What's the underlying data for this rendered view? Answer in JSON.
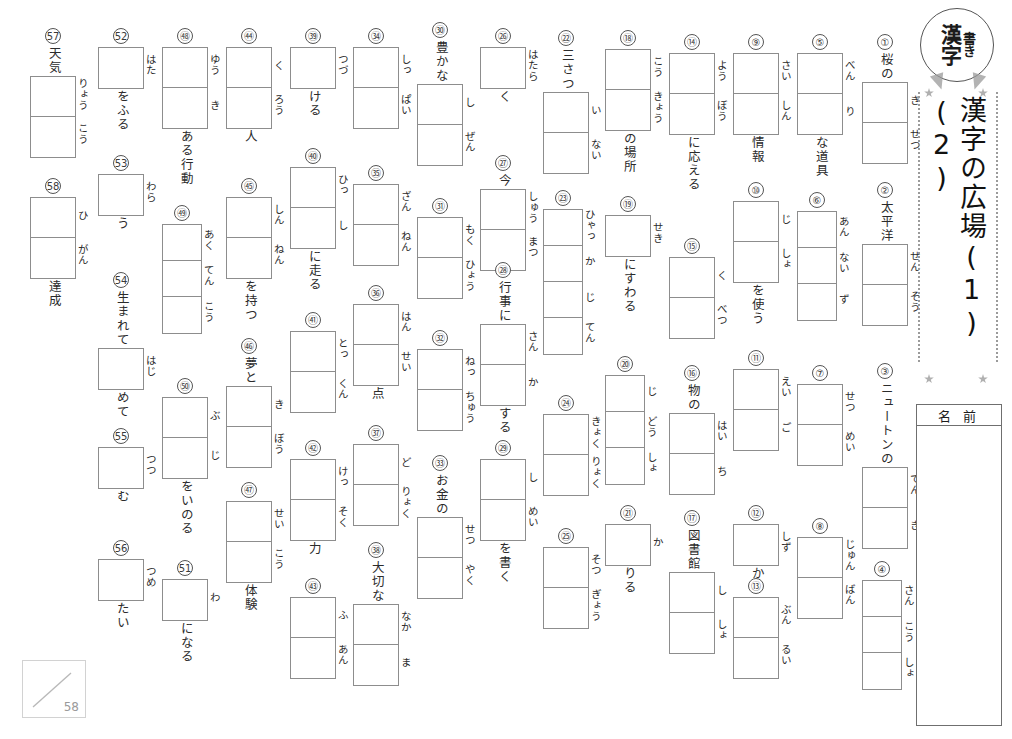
{
  "header": {
    "badge_main": "漢字",
    "badge_sub": "書き",
    "title": "漢字の広場",
    "unit_1": "(1)",
    "unit_2": "(2)",
    "name_label": "名 前"
  },
  "score": {
    "total": "58"
  },
  "problems": [
    {
      "no": "①",
      "pre": "桜の",
      "post": "",
      "readings": [
        "き",
        "せつ"
      ],
      "cells": 2
    },
    {
      "no": "②",
      "pre": "太平洋",
      "post": "",
      "readings": [
        "せん",
        "そう"
      ],
      "cells": 2
    },
    {
      "no": "③",
      "pre": "ニュートンの",
      "post": "",
      "readings": [
        "てん",
        "き"
      ],
      "cells": 2
    },
    {
      "no": "④",
      "pre": "",
      "post": "",
      "readings": [
        "さん",
        "こう",
        "しょ"
      ],
      "cells": 3
    },
    {
      "no": "⑤",
      "pre": "",
      "post": "な道具",
      "readings": [
        "べん",
        "り"
      ],
      "cells": 2
    },
    {
      "no": "⑥",
      "pre": "",
      "post": "",
      "readings": [
        "あん",
        "ない",
        "ず"
      ],
      "cells": 3
    },
    {
      "no": "⑦",
      "pre": "",
      "post": "",
      "readings": [
        "せつ",
        "めい"
      ],
      "cells": 2
    },
    {
      "no": "⑧",
      "pre": "",
      "post": "",
      "readings": [
        "じゅん",
        "ばん"
      ],
      "cells": 2
    },
    {
      "no": "⑨",
      "pre": "",
      "post": "情報",
      "readings": [
        "さい",
        "しん"
      ],
      "cells": 2
    },
    {
      "no": "⑩",
      "pre": "",
      "post": "を使う",
      "readings": [
        "じ",
        "しょ"
      ],
      "cells": 2
    },
    {
      "no": "⑪",
      "pre": "",
      "post": "",
      "readings": [
        "えい",
        "ご"
      ],
      "cells": 2
    },
    {
      "no": "⑫",
      "pre": "",
      "post": "か",
      "readings": [
        "しず"
      ],
      "cells": 1
    },
    {
      "no": "⑬",
      "pre": "",
      "post": "",
      "readings": [
        "ぶん",
        "るい"
      ],
      "cells": 2
    },
    {
      "no": "⑭",
      "pre": "",
      "post": "に応える",
      "readings": [
        "よう",
        "ぼう"
      ],
      "cells": 2
    },
    {
      "no": "⑮",
      "pre": "",
      "post": "",
      "readings": [
        "く",
        "べつ"
      ],
      "cells": 2
    },
    {
      "no": "⑯",
      "pre": "物の",
      "post": "",
      "readings": [
        "はい",
        "ち"
      ],
      "cells": 2
    },
    {
      "no": "⑰",
      "pre": "図書館",
      "post": "",
      "readings": [
        "し",
        "しょ"
      ],
      "cells": 2
    },
    {
      "no": "⑱",
      "pre": "",
      "post": "の場所",
      "readings": [
        "こう",
        "きょう"
      ],
      "cells": 2
    },
    {
      "no": "⑲",
      "pre": "",
      "post": "にすわる",
      "readings": [
        "せき"
      ],
      "cells": 1
    },
    {
      "no": "⑳",
      "pre": "",
      "post": "",
      "readings": [
        "じ",
        "どう",
        "しょ"
      ],
      "cells": 3
    },
    {
      "no": "㉑",
      "pre": "",
      "post": "りる",
      "readings": [
        "か"
      ],
      "cells": 1
    },
    {
      "no": "㉒",
      "pre": "三さつ",
      "post": "",
      "readings": [
        "い",
        "ない"
      ],
      "cells": 2
    },
    {
      "no": "㉓",
      "pre": "",
      "post": "",
      "readings": [
        "ひゃっ",
        "か",
        "じ",
        "てん"
      ],
      "cells": 4
    },
    {
      "no": "㉔",
      "pre": "",
      "post": "",
      "readings": [
        "きょく",
        "りょく"
      ],
      "cells": 2
    },
    {
      "no": "㉕",
      "pre": "",
      "post": "",
      "readings": [
        "そつ",
        "ぎょう"
      ],
      "cells": 2
    },
    {
      "no": "㉖",
      "pre": "",
      "post": "く",
      "readings": [
        "はたら"
      ],
      "cells": 1
    },
    {
      "no": "㉗",
      "pre": "今",
      "post": "",
      "readings": [
        "しゅう",
        "まつ"
      ],
      "cells": 2
    },
    {
      "no": "㉘",
      "pre": "行事に",
      "post": "する",
      "readings": [
        "さん",
        "か"
      ],
      "cells": 2
    },
    {
      "no": "㉙",
      "pre": "",
      "post": "を書く",
      "readings": [
        "し",
        "めい"
      ],
      "cells": 2
    },
    {
      "no": "㉚",
      "pre": "豊かな",
      "post": "",
      "readings": [
        "し",
        "ぜん"
      ],
      "cells": 2
    },
    {
      "no": "㉛",
      "pre": "",
      "post": "",
      "readings": [
        "もく",
        "ひょう"
      ],
      "cells": 2
    },
    {
      "no": "㉜",
      "pre": "",
      "post": "",
      "readings": [
        "ねっ",
        "ちゅう"
      ],
      "cells": 2
    },
    {
      "no": "㉝",
      "pre": "お金の",
      "post": "",
      "readings": [
        "せつ",
        "やく"
      ],
      "cells": 2
    },
    {
      "no": "㉞",
      "pre": "",
      "post": "",
      "readings": [
        "しっ",
        "ぱい"
      ],
      "cells": 2
    },
    {
      "no": "㉟",
      "pre": "",
      "post": "",
      "readings": [
        "ざん",
        "ねん"
      ],
      "cells": 2
    },
    {
      "no": "㊱",
      "pre": "",
      "post": "点",
      "readings": [
        "はん",
        "せい"
      ],
      "cells": 2
    },
    {
      "no": "㊲",
      "pre": "",
      "post": "",
      "readings": [
        "ど",
        "りょく"
      ],
      "cells": 2
    },
    {
      "no": "㊳",
      "pre": "大切な",
      "post": "",
      "readings": [
        "なか",
        "ま"
      ],
      "cells": 2
    },
    {
      "no": "㊴",
      "pre": "",
      "post": "ける",
      "readings": [
        "つづ"
      ],
      "cells": 1
    },
    {
      "no": "㊵",
      "pre": "",
      "post": "に走る",
      "readings": [
        "ひっ",
        "し"
      ],
      "cells": 2
    },
    {
      "no": "㊶",
      "pre": "",
      "post": "",
      "readings": [
        "とっ",
        "くん"
      ],
      "cells": 2
    },
    {
      "no": "㊷",
      "pre": "",
      "post": "力",
      "readings": [
        "けっ",
        "そく"
      ],
      "cells": 2
    },
    {
      "no": "㊸",
      "pre": "",
      "post": "",
      "readings": [
        "ふ",
        "あん"
      ],
      "cells": 2
    },
    {
      "no": "㊹",
      "pre": "",
      "post": "人",
      "readings": [
        "く",
        "ろう"
      ],
      "cells": 2
    },
    {
      "no": "㊺",
      "pre": "",
      "post": "を持つ",
      "readings": [
        "しん",
        "ねん"
      ],
      "cells": 2
    },
    {
      "no": "㊻",
      "pre": "夢と",
      "post": "",
      "readings": [
        "き",
        "ぼう"
      ],
      "cells": 2
    },
    {
      "no": "㊼",
      "pre": "",
      "post": "体験",
      "readings": [
        "せい",
        "こう"
      ],
      "cells": 2
    },
    {
      "no": "㊽",
      "pre": "",
      "post": "ある行動",
      "readings": [
        "ゆう",
        "き"
      ],
      "cells": 2
    },
    {
      "no": "㊾",
      "pre": "",
      "post": "",
      "readings": [
        "あく",
        "てん",
        "こう"
      ],
      "cells": 3
    },
    {
      "no": "㊿",
      "pre": "",
      "post": "をいのる",
      "readings": [
        "ぶ",
        "じ"
      ],
      "cells": 2
    },
    {
      "no": "51",
      "pre": "",
      "post": "になる",
      "readings": [
        "わ"
      ],
      "cells": 1
    },
    {
      "no": "52",
      "pre": "",
      "post": "をふる",
      "readings": [
        "はた"
      ],
      "cells": 1
    },
    {
      "no": "53",
      "pre": "",
      "post": "う",
      "readings": [
        "わら"
      ],
      "cells": 1
    },
    {
      "no": "54",
      "pre": "生まれて",
      "post": "めて",
      "readings": [
        "はじ"
      ],
      "cells": 1
    },
    {
      "no": "55",
      "pre": "",
      "post": "む",
      "readings": [
        "つつ"
      ],
      "cells": 1
    },
    {
      "no": "56",
      "pre": "",
      "post": "たい",
      "readings": [
        "つめ"
      ],
      "cells": 1
    },
    {
      "no": "57",
      "pre": "天気",
      "post": "",
      "readings": [
        "りょう",
        "こう"
      ],
      "cells": 2
    },
    {
      "no": "58",
      "pre": "",
      "post": "達成",
      "readings": [
        "ひ",
        "がん"
      ],
      "cells": 2
    }
  ],
  "layout": [
    {
      "no": "①",
      "x": 862,
      "y": 34
    },
    {
      "no": "②",
      "x": 862,
      "y": 182
    },
    {
      "no": "③",
      "x": 862,
      "y": 363
    },
    {
      "no": "④",
      "x": 862,
      "y": 561
    },
    {
      "no": "⑤",
      "x": 797,
      "y": 34
    },
    {
      "no": "⑥",
      "x": 797,
      "y": 192
    },
    {
      "no": "⑦",
      "x": 797,
      "y": 365
    },
    {
      "no": "⑧",
      "x": 797,
      "y": 518
    },
    {
      "no": "⑨",
      "x": 733,
      "y": 34
    },
    {
      "no": "⑩",
      "x": 733,
      "y": 182
    },
    {
      "no": "⑪",
      "x": 733,
      "y": 350
    },
    {
      "no": "⑫",
      "x": 733,
      "y": 505
    },
    {
      "no": "⑬",
      "x": 733,
      "y": 578
    },
    {
      "no": "⑭",
      "x": 669,
      "y": 34
    },
    {
      "no": "⑮",
      "x": 669,
      "y": 238
    },
    {
      "no": "⑯",
      "x": 669,
      "y": 365
    },
    {
      "no": "⑰",
      "x": 669,
      "y": 510
    },
    {
      "no": "⑱",
      "x": 605,
      "y": 30
    },
    {
      "no": "⑲",
      "x": 605,
      "y": 196
    },
    {
      "no": "⑳",
      "x": 605,
      "y": 356
    },
    {
      "no": "㉑",
      "x": 605,
      "y": 505
    },
    {
      "no": "㉒",
      "x": 543,
      "y": 30
    },
    {
      "no": "㉓",
      "x": 543,
      "y": 190
    },
    {
      "no": "㉔",
      "x": 543,
      "y": 395
    },
    {
      "no": "㉕",
      "x": 543,
      "y": 528
    },
    {
      "no": "㉖",
      "x": 480,
      "y": 28
    },
    {
      "no": "㉗",
      "x": 480,
      "y": 155
    },
    {
      "no": "㉘",
      "x": 480,
      "y": 262
    },
    {
      "no": "㉙",
      "x": 480,
      "y": 440
    },
    {
      "no": "㉚",
      "x": 417,
      "y": 22
    },
    {
      "no": "㉛",
      "x": 417,
      "y": 198
    },
    {
      "no": "㉜",
      "x": 417,
      "y": 330
    },
    {
      "no": "㉝",
      "x": 417,
      "y": 455
    },
    {
      "no": "㉞",
      "x": 353,
      "y": 28
    },
    {
      "no": "㉟",
      "x": 353,
      "y": 165
    },
    {
      "no": "㊱",
      "x": 353,
      "y": 285
    },
    {
      "no": "㊲",
      "x": 353,
      "y": 425
    },
    {
      "no": "㊳",
      "x": 353,
      "y": 542
    },
    {
      "no": "㊴",
      "x": 290,
      "y": 28
    },
    {
      "no": "㊵",
      "x": 290,
      "y": 148
    },
    {
      "no": "㊶",
      "x": 290,
      "y": 312
    },
    {
      "no": "㊷",
      "x": 290,
      "y": 440
    },
    {
      "no": "㊸",
      "x": 290,
      "y": 578
    },
    {
      "no": "㊹",
      "x": 226,
      "y": 28
    },
    {
      "no": "㊺",
      "x": 226,
      "y": 178
    },
    {
      "no": "㊻",
      "x": 226,
      "y": 338
    },
    {
      "no": "㊼",
      "x": 226,
      "y": 482
    },
    {
      "no": "㊽",
      "x": 162,
      "y": 28
    },
    {
      "no": "㊾",
      "x": 162,
      "y": 205
    },
    {
      "no": "㊿",
      "x": 162,
      "y": 378
    },
    {
      "no": "51",
      "x": 162,
      "y": 560
    },
    {
      "no": "52",
      "x": 98,
      "y": 28
    },
    {
      "no": "53",
      "x": 98,
      "y": 155
    },
    {
      "no": "54",
      "x": 98,
      "y": 272
    },
    {
      "no": "55",
      "x": 98,
      "y": 428
    },
    {
      "no": "56",
      "x": 98,
      "y": 540
    },
    {
      "no": "57",
      "x": 30,
      "y": 28
    },
    {
      "no": "58",
      "x": 30,
      "y": 178
    }
  ]
}
